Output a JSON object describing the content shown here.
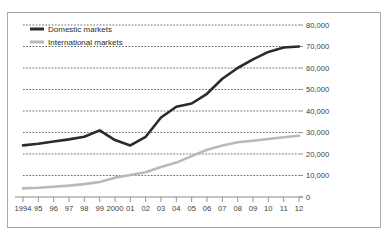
{
  "chart_data": {
    "type": "line",
    "title": "",
    "subtitle": "",
    "xlabel": "",
    "ylabel": "",
    "x": [
      "1994",
      "95",
      "96",
      "97",
      "98",
      "99",
      "2000",
      "01",
      "02",
      "03",
      "04",
      "05",
      "06",
      "07",
      "08",
      "09",
      "10",
      "11",
      "12"
    ],
    "xtick_labels": [
      "1994",
      "95",
      "96",
      "97",
      "98",
      "99",
      "2000",
      "01",
      "02",
      "03",
      "04",
      "05",
      "06",
      "07",
      "08",
      "09",
      "10",
      "11",
      "12"
    ],
    "ytick_labels": [
      "80,000",
      "70,000",
      "60,000",
      "50,000",
      "40,000",
      "30,000",
      "20,000",
      "10,000",
      "0"
    ],
    "ytick_values": [
      80000,
      70000,
      60000,
      50000,
      40000,
      30000,
      20000,
      10000,
      0
    ],
    "ylim": [
      0,
      80000
    ],
    "y_axis_position": "right",
    "grid": "horizontal-dotted",
    "legend_position": "top-left",
    "series": [
      {
        "name": "Domestic markets",
        "color": "#2b2b2b",
        "line_width": 2.6,
        "values": [
          24000,
          24800,
          25800,
          26800,
          28000,
          31000,
          26500,
          24000,
          28000,
          37000,
          42000,
          43500,
          48000,
          55000,
          60000,
          64000,
          67500,
          69500,
          70000
        ]
      },
      {
        "name": "International markets",
        "color": "#b9b9b9",
        "line_width": 2.6,
        "values": [
          4000,
          4300,
          4800,
          5300,
          6000,
          7000,
          9000,
          10200,
          11500,
          14000,
          16000,
          19000,
          22000,
          24000,
          25500,
          26200,
          27000,
          27800,
          28500
        ]
      }
    ]
  },
  "legend": {
    "entries": [
      {
        "label": "Domestic markets",
        "color": "#2b2b2b"
      },
      {
        "label": "International markets",
        "color": "#b9b9b9"
      }
    ]
  },
  "colors": {
    "domestic": "#2b2b2b",
    "international": "#b9b9b9",
    "grid": "#555555",
    "axis": "#888888",
    "border": "#a8a8a8",
    "text": "#404040",
    "background": "#ffffff"
  }
}
